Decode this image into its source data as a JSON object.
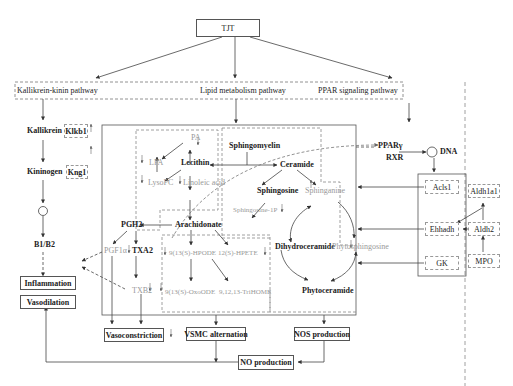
{
  "root": {
    "label": "TJT"
  },
  "pathways": {
    "kallikrein": "Kallikrein-kinin pathway",
    "lipid": "Lipid metabolism pathway",
    "ppar": "PPAR signaling pathway"
  },
  "kallikrein_chain": {
    "kallikrein": "Kallikrein",
    "klkb1": "Klkb1",
    "kininogen": "Kininogen",
    "kng1": "Kng1",
    "b1b2": "B1/B2"
  },
  "outcomes": {
    "inflammation": "Inflammation",
    "vasodilation": "Vasodilation",
    "vasoconstriction": "Vasoconstriction",
    "vsmc": "VSMC alternation",
    "nos": "NOS production",
    "no": "NO production"
  },
  "lipid": {
    "pa": "PA",
    "lpa": "LPA",
    "lecithin": "Lecithin",
    "lysopc": "LysoPC",
    "linoleic": "Linoleic acid",
    "arachidonate": "Arachidonate",
    "pgh2": "PGH2",
    "pgf1a": "PGF1α",
    "txa2": "TXA2",
    "txb2": "TXB2",
    "hpode": "9(13(S)-HPODE",
    "hpete": "12(S)-HPETE",
    "oxoode": "9(13(S)-OxoODE",
    "trihome": "9,12,13-TriHOME"
  },
  "sphingo": {
    "sphingomyelin": "Sphingomyelin",
    "ceramide": "Ceramide",
    "sphingosine": "Sphingosine",
    "sphinganine": "Sphinganine",
    "sphingosine1p": "Sphingosine-1P",
    "dihydroceramide": "Dihydroceramide",
    "phytosphingosine": "Phytosphingosine",
    "phytoceramide": "Phytoceramide"
  },
  "ppar": {
    "ppary": "PPARγ",
    "rxr": "RXR",
    "dna": "DNA",
    "acls1": "Acls1",
    "ehhadh": "Ehhadh",
    "gk": "GK",
    "aldh1a1": "Aldh1a1",
    "aldh2": "Aldh2",
    "mpo": "MPO"
  },
  "colors": {
    "line": "#444444",
    "dashed": "#888888",
    "gray_text": "#999999"
  }
}
